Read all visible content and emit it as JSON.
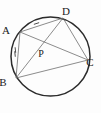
{
  "figure": {
    "kind": "circle-geometry-diagram",
    "background_color": "#fdfdfd",
    "circle_color": "#2b2b2b",
    "chord_color": "#6e6e6e",
    "tick_color": "#3a3a3a",
    "label_color": "#1a1a1a"
  },
  "circle": {
    "name": "circumscribed-circle",
    "cx": 50.5,
    "cy": 56.5,
    "r": 39.5
  },
  "points": [
    {
      "id": "A",
      "label": "A",
      "x": 20.0,
      "y": 32.0,
      "label_x": 6.0,
      "label_y": 34.0,
      "on_circle": true
    },
    {
      "id": "D",
      "label": "D",
      "x": 63.0,
      "y": 18.0,
      "label_x": 66.0,
      "label_y": 15.0,
      "on_circle": true
    },
    {
      "id": "C",
      "label": "C",
      "x": 88.0,
      "y": 60.0,
      "label_x": 90.0,
      "label_y": 66.0,
      "on_circle": true
    },
    {
      "id": "B",
      "label": "B",
      "x": 16.0,
      "y": 78.0,
      "label_x": 3.0,
      "label_y": 86.0,
      "on_circle": true
    },
    {
      "id": "P",
      "label": "P",
      "x": 45.0,
      "y": 47.0,
      "label_x": 41.0,
      "label_y": 57.0,
      "on_circle": false
    }
  ],
  "segments": [
    {
      "id": "AD",
      "name": "chord-a-d",
      "from": "A",
      "to": "D",
      "ticks": 1
    },
    {
      "id": "AB",
      "name": "chord-a-b",
      "from": "A",
      "to": "B",
      "ticks": 2
    },
    {
      "id": "BC",
      "name": "chord-b-c",
      "from": "B",
      "to": "C",
      "ticks": 0
    },
    {
      "id": "DC",
      "name": "chord-d-c",
      "from": "D",
      "to": "C",
      "ticks": 0
    },
    {
      "id": "AC",
      "name": "diagonal-a-c",
      "from": "A",
      "to": "C",
      "ticks": 0
    },
    {
      "id": "BD",
      "name": "diagonal-b-d",
      "from": "B",
      "to": "D",
      "ticks": 0
    }
  ],
  "tick_marks": [
    {
      "id": "tick-ad-1",
      "name": "congruence-tick-ad",
      "segment": "AD",
      "x": 36.5,
      "y": 23.5,
      "angle": -18,
      "length": 5.5
    },
    {
      "id": "tick-ab-1",
      "name": "congruence-tick-ab-first",
      "segment": "AB",
      "x": 15.4,
      "y": 50.0,
      "angle": 84,
      "length": 5.5
    },
    {
      "id": "tick-ab-2",
      "name": "congruence-tick-ab-second",
      "segment": "AB",
      "x": 15.0,
      "y": 54.0,
      "angle": 84,
      "length": 5.5
    }
  ],
  "labels": {
    "a": "A",
    "b": "B",
    "c": "C",
    "d": "D",
    "p": "P"
  }
}
